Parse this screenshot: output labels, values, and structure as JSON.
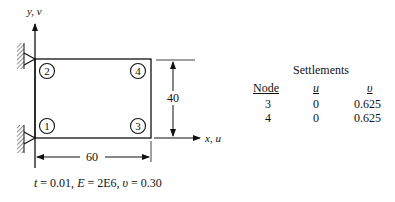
{
  "figure": {
    "y_axis_label": "y, v",
    "x_axis_label": "x, u",
    "nodes": [
      {
        "id": "1",
        "x": 47,
        "y": 126
      },
      {
        "id": "2",
        "x": 47,
        "y": 71
      },
      {
        "id": "3",
        "x": 138,
        "y": 126
      },
      {
        "id": "4",
        "x": 138,
        "y": 71
      }
    ],
    "height_dimension": "40",
    "width_dimension": "60",
    "properties": {
      "t_label": "t",
      "t_value": " = 0.01, ",
      "E_label": "E",
      "E_value": " = 2E6, ",
      "nu_label": "υ",
      "nu_value": " = 0.30"
    }
  },
  "settlements": {
    "title": "Settlements",
    "headers": {
      "node": "Node",
      "u": "u",
      "v": "υ"
    },
    "rows": [
      {
        "node": "3",
        "u": "0",
        "v": "0.625"
      },
      {
        "node": "4",
        "u": "0",
        "v": "0.625"
      }
    ]
  }
}
